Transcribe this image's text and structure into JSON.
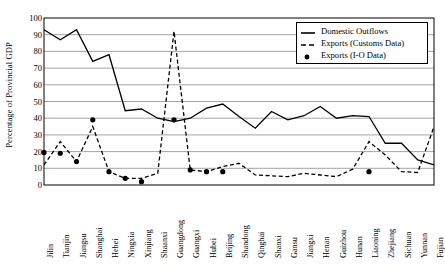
{
  "chart_data": {
    "type": "line",
    "title": "",
    "xlabel": "",
    "ylabel": "Percentage of Provincial GDP",
    "ylim": [
      0,
      100
    ],
    "ytick_step": 10,
    "yticks": [
      0,
      10,
      20,
      30,
      40,
      50,
      60,
      70,
      80,
      90,
      100
    ],
    "grid": "horizontal",
    "legend_position": "top-right",
    "categories": [
      "Jilin",
      "Tianjin",
      "Jiangsu",
      "Shanghai",
      "Hebei",
      "Ningxia",
      "Xinjiang",
      "Shaanxi",
      "Guangdong",
      "Guangxi",
      "Hubei",
      "Beijing",
      "Shandong",
      "Qinghai",
      "Shanxi",
      "Gansu",
      "Jiangxi",
      "Henan",
      "Guizhou",
      "Hunan",
      "Liaoning",
      "Zhejiang",
      "Sichuan",
      "Yunnan",
      "Fujian"
    ],
    "series": [
      {
        "name": "Domestic Outflows",
        "style": "solid",
        "color": "#000000",
        "values": [
          93,
          87,
          93,
          74,
          78,
          44.5,
          45.5,
          40,
          38,
          40,
          46,
          48.5,
          41,
          34,
          44,
          39,
          41.5,
          47,
          40,
          41.5,
          41,
          25,
          25,
          15,
          12
        ]
      },
      {
        "name": "Exports (Customs Data)",
        "style": "dashed",
        "color": "#000000",
        "values": [
          12,
          26,
          14,
          35,
          8,
          4,
          4,
          7,
          92,
          9,
          8,
          11,
          13,
          6,
          5.5,
          5,
          7,
          6,
          5,
          9.5,
          26,
          18,
          8,
          7.5,
          35
        ]
      },
      {
        "name": "Exports (I-O Data)",
        "style": "markers",
        "color": "#000000",
        "marker": "filled-circle",
        "points": [
          {
            "x": "Jilin",
            "y": 19.5
          },
          {
            "x": "Tianjin",
            "y": 19
          },
          {
            "x": "Jiangsu",
            "y": 14
          },
          {
            "x": "Shanghai",
            "y": 39
          },
          {
            "x": "Hebei",
            "y": 8
          },
          {
            "x": "Ningxia",
            "y": 4
          },
          {
            "x": "Xinjiang",
            "y": 2
          },
          {
            "x": "Guangdong",
            "y": 39
          },
          {
            "x": "Guangxi",
            "y": 9
          },
          {
            "x": "Hubei",
            "y": 8
          },
          {
            "x": "Beijing",
            "y": 8
          },
          {
            "x": "Liaoning",
            "y": 8
          }
        ]
      }
    ]
  },
  "legend": {
    "items": [
      {
        "label": "Domestic Outflows",
        "key": "solid-line-key"
      },
      {
        "label": "Exports (Customs Data)",
        "key": "dashed-line-key"
      },
      {
        "label": "Exports (I-O Data)",
        "key": "dot-marker-key"
      }
    ]
  }
}
